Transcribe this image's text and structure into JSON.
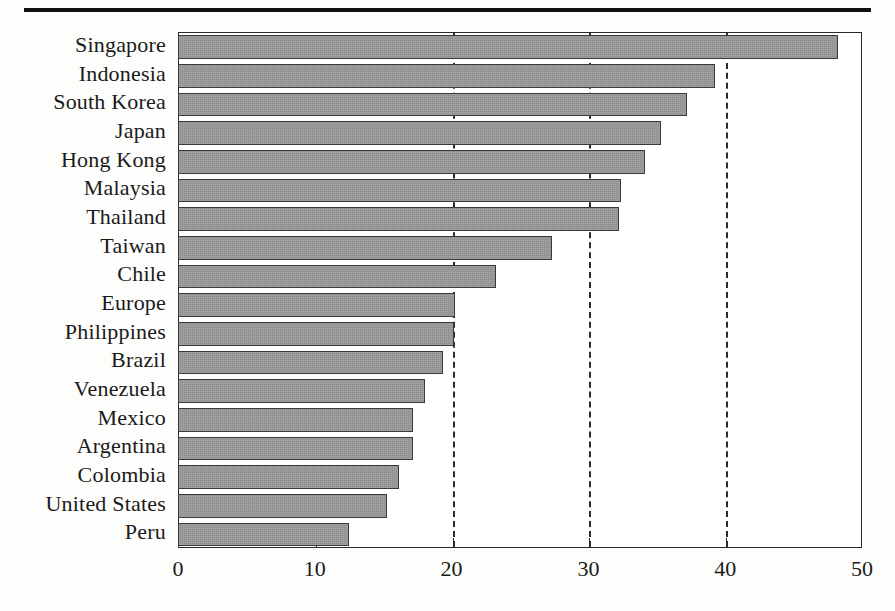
{
  "chart_data": {
    "type": "bar",
    "orientation": "horizontal",
    "title": "",
    "subtitle": "",
    "xlabel": "",
    "ylabel": "",
    "xlim": [
      0,
      50
    ],
    "xticks": [
      0,
      10,
      20,
      30,
      40,
      50
    ],
    "xtick_labels": [
      "0",
      "10",
      "20",
      "30",
      "40",
      "50"
    ],
    "grid": "vertical dashed gridlines at 20, 30 and 40",
    "gridlines": [
      20,
      30,
      40
    ],
    "legend": null,
    "legend_position": "none",
    "bar_color": "#8d8d8d",
    "bar_edge_color": "#3a3a3a",
    "categories": [
      "Singapore",
      "Indonesia",
      "South Korea",
      "Japan",
      "Hong Kong",
      "Malaysia",
      "Thailand",
      "Taiwan",
      "Chile",
      "Europe",
      "Philippines",
      "Brazil",
      "Venezuela",
      "Mexico",
      "Argentina",
      "Colombia",
      "United States",
      "Peru"
    ],
    "values": [
      48.2,
      39.2,
      37.1,
      35.2,
      34.1,
      32.3,
      32.2,
      27.3,
      23.2,
      20.2,
      20.1,
      19.3,
      18.0,
      17.1,
      17.1,
      16.1,
      15.2,
      12.4
    ]
  },
  "decorations": {
    "top_rule": "horizontal-rule"
  }
}
